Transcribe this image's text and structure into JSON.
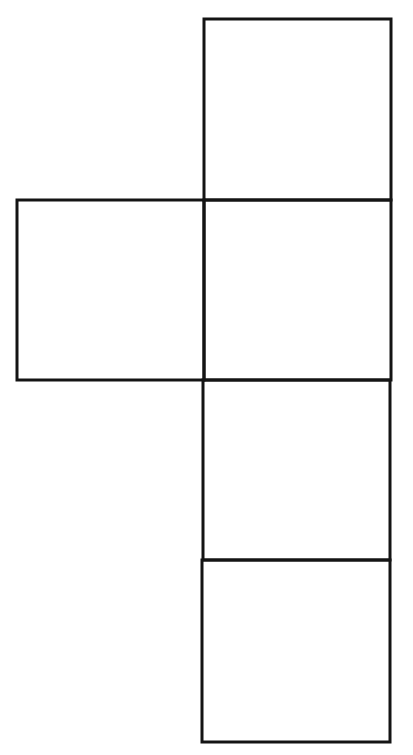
{
  "diagram": {
    "type": "cube-net",
    "stroke_color": "#141414",
    "background_color": "#ffffff",
    "stroke_width": 3,
    "faces": [
      {
        "id": "face-top",
        "x": 204,
        "y": 19,
        "w": 187,
        "h": 181
      },
      {
        "id": "face-left",
        "x": 17,
        "y": 200,
        "w": 187,
        "h": 180
      },
      {
        "id": "face-center",
        "x": 204,
        "y": 200,
        "w": 187,
        "h": 180
      },
      {
        "id": "face-lower",
        "x": 203,
        "y": 380,
        "w": 187,
        "h": 180
      },
      {
        "id": "face-bottom",
        "x": 202,
        "y": 560,
        "w": 188,
        "h": 182
      }
    ]
  }
}
